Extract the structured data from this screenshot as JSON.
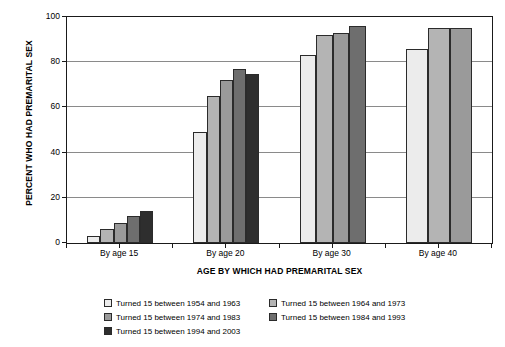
{
  "chart_data": {
    "type": "bar",
    "title": "",
    "xlabel": "AGE BY WHICH HAD PREMARITAL SEX",
    "ylabel": "PERCENT WHO HAD PREMARITAL SEX",
    "categories": [
      "By age 15",
      "By age 20",
      "By age 30",
      "By age 40"
    ],
    "ylim": [
      0,
      100
    ],
    "yticks": [
      0,
      20,
      40,
      60,
      80,
      100
    ],
    "ytick_labels": [
      "0",
      "20",
      "40",
      "60",
      "80",
      "100"
    ],
    "grid": true,
    "legend_position": "bottom",
    "series": [
      {
        "name": "Turned 15 between 1954 and 1963",
        "color": "#ececec",
        "values": [
          3,
          49,
          83,
          86
        ]
      },
      {
        "name": "Turned 15 between 1964 and 1973",
        "color": "#b4b4b4",
        "values": [
          6,
          65,
          92,
          95
        ]
      },
      {
        "name": "Turned 15 between 1974 and 1983",
        "color": "#9a9a9a",
        "values": [
          9,
          72,
          93,
          95
        ]
      },
      {
        "name": "Turned 15 between 1984 and 1993",
        "color": "#6e6e6e",
        "values": [
          12,
          77,
          96,
          null
        ]
      },
      {
        "name": "Turned 15 between 1994 and 2003",
        "color": "#2e2e2e",
        "values": [
          14,
          75,
          null,
          null
        ]
      }
    ]
  }
}
